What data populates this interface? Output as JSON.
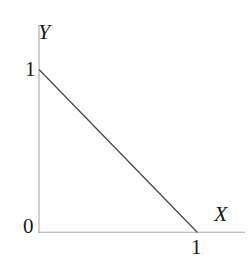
{
  "figure": {
    "title": "",
    "background_color": "#ffffff",
    "width": 250,
    "height": 265
  },
  "axes": {
    "x": {
      "label": "X",
      "label_icon": "axis-x-label",
      "color": "#a8a8a8",
      "tick_labels": [
        "1"
      ],
      "origin_label": "0"
    },
    "y": {
      "label": "Y",
      "label_icon": "axis-y-label",
      "color": "#a8a8a8",
      "tick_labels": [
        "1"
      ]
    }
  },
  "labels": {
    "axis_y": "Y",
    "axis_x": "X",
    "tick_y_one": "1",
    "tick_x_one": "1",
    "origin": "0"
  },
  "chart_data": {
    "type": "line",
    "title": "",
    "subtitle": "",
    "xlabel": "X",
    "ylabel": "Y",
    "xlim": [
      0,
      1.3
    ],
    "ylim": [
      0,
      1.3
    ],
    "xticks": [
      0,
      1
    ],
    "yticks": [
      0,
      1
    ],
    "xticklabels": [
      "0",
      "1"
    ],
    "yticklabels": [
      "0",
      "1"
    ],
    "grid": false,
    "legend": null,
    "legend_position": "none",
    "annotations": [],
    "series": [
      {
        "name": "x + y = 1",
        "color": "#4a4a4a",
        "linewidth": 1.3,
        "x": [
          0,
          1
        ],
        "y": [
          1,
          0
        ]
      }
    ]
  },
  "colors": {
    "axis": "#a8a8a8",
    "line": "#4a4a4a",
    "text": "#1a1a1a",
    "background": "#ffffff"
  }
}
